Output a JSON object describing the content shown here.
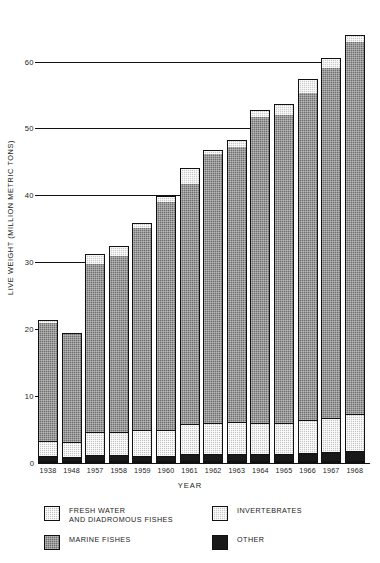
{
  "chart_data": {
    "type": "bar",
    "subtype": "stacked-vertical",
    "title": "",
    "xlabel": "YEAR",
    "ylabel": "LIVE WEIGHT (MILLION METRIC TONS)",
    "ylim": [
      0,
      68
    ],
    "yticks": [
      0,
      10,
      20,
      30,
      40,
      50,
      60
    ],
    "ytick_labels": [
      "0",
      "10",
      "20",
      "30",
      "40",
      "50",
      "60"
    ],
    "grid": "horizontal-at-major-y-ticks",
    "legend_position": "below-axes",
    "categories": [
      "1938",
      "1948",
      "1957",
      "1958",
      "1959",
      "1960",
      "1961",
      "1962",
      "1963",
      "1964",
      "1965",
      "1966",
      "1967",
      "1968"
    ],
    "stack_order_bottom_to_top": [
      "OTHER",
      "FRESH WATER AND DIADROMOUS FISHES",
      "MARINE FISHES",
      "INVERTEBRATES"
    ],
    "series": [
      {
        "name": "OTHER",
        "color": "#191919",
        "values": [
          0.8,
          0.6,
          0.9,
          0.9,
          0.7,
          0.7,
          1.0,
          1.1,
          1.1,
          1.1,
          1.1,
          1.2,
          1.3,
          1.5
        ]
      },
      {
        "name": "FRESH WATER AND DIADROMOUS FISHES",
        "color": "#c4c4c4",
        "values": [
          2.3,
          2.4,
          3.5,
          3.4,
          3.9,
          4.0,
          4.5,
          4.6,
          4.8,
          4.6,
          4.6,
          5.0,
          5.1,
          5.6
        ]
      },
      {
        "name": "MARINE FISHES",
        "color": "#6f6f6f",
        "values": [
          18.0,
          17.3,
          25.5,
          26.7,
          30.7,
          34.4,
          36.4,
          40.7,
          41.5,
          46.2,
          46.5,
          49.3,
          52.7,
          56.0
        ]
      },
      {
        "name": "INVERTEBRATES",
        "color": "#c9c9c9",
        "values": [
          21.3,
          19.5,
          31.3,
          32.5,
          35.8,
          39.9,
          44.1,
          46.8,
          48.3,
          52.8,
          53.7,
          57.4,
          60.6,
          64.0
        ]
      }
    ],
    "series_note": "INVERTEBRATES values listed are cumulative bar totals; segment height = total minus sum of lower segments",
    "totals": [
      21.3,
      19.5,
      31.3,
      32.5,
      35.8,
      39.9,
      44.1,
      46.8,
      48.3,
      52.8,
      53.7,
      57.4,
      60.6,
      64.0
    ]
  },
  "legend": {
    "items": [
      {
        "label": "FRESH WATER\nAND DIADROMOUS FISHES",
        "swatch": "fresh"
      },
      {
        "label": "MARINE FISHES",
        "swatch": "marine"
      },
      {
        "label": "INVERTEBRATES",
        "swatch": "invertebrates"
      },
      {
        "label": "OTHER",
        "swatch": "other"
      }
    ]
  },
  "axes": {
    "y_title": "LIVE WEIGHT (MILLION METRIC TONS)",
    "x_title": "YEAR",
    "y_zero_label": "0"
  }
}
